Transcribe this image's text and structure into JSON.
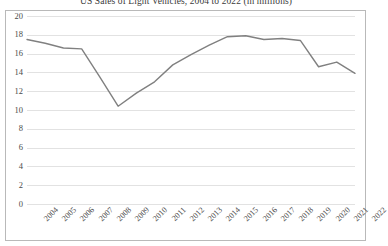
{
  "chart_data": {
    "type": "line",
    "title": "US Sales of Light Vehicles, 2004 to 2022 (in millions)",
    "xlabel": "",
    "ylabel": "",
    "ylim": [
      0,
      20
    ],
    "yticks": [
      0,
      2,
      4,
      6,
      8,
      10,
      12,
      14,
      16,
      18,
      20
    ],
    "grid": true,
    "legend": false,
    "legend_position": "none",
    "categories": [
      "2004",
      "2005",
      "2006",
      "2007",
      "2008",
      "2009",
      "2010",
      "2011",
      "2012",
      "2013",
      "2014",
      "2015",
      "2016",
      "2017",
      "2018",
      "2019",
      "2020",
      "2021",
      "2022"
    ],
    "series": [
      {
        "name": "US Sales of Light Vehicles",
        "color": "#808080",
        "values": [
          17.5,
          17.1,
          16.6,
          16.5,
          13.5,
          10.4,
          11.8,
          13.0,
          14.8,
          15.9,
          16.9,
          17.8,
          17.9,
          17.5,
          17.6,
          17.4,
          14.6,
          15.1,
          13.9
        ]
      }
    ]
  },
  "style": {
    "line_color": "#808080",
    "gridline_color": "#e2e2e2",
    "border_color": "#b9b9b9",
    "text_color": "#4a4a4a",
    "background": "#ffffff"
  }
}
